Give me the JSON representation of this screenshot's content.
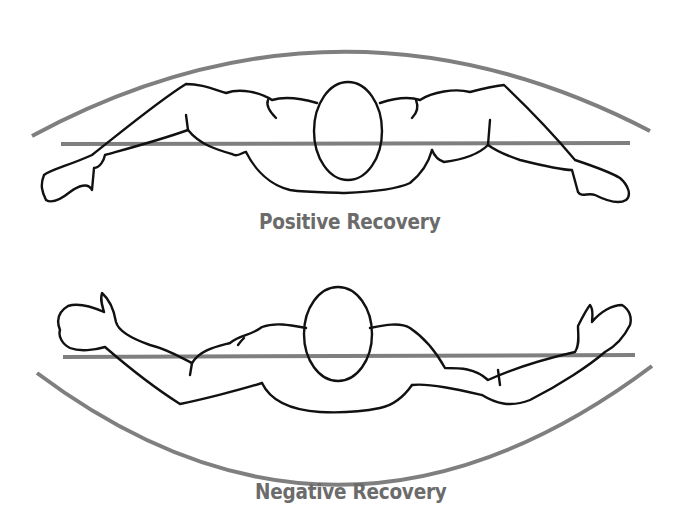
{
  "figure": {
    "panels": [
      {
        "label": "Positive Recovery",
        "arc_direction": "convex-up",
        "description": "Swimmer viewed from front, arms swept up and outward above the horizontal reference line"
      },
      {
        "label": "Negative Recovery",
        "arc_direction": "concave-up",
        "description": "Swimmer viewed from front, arms raised with hands high but elbows dropping below the horizontal reference line"
      }
    ],
    "colors": {
      "line": "#7f7f7f",
      "outline": "#111111",
      "label": "#6b6b6b",
      "background": "#ffffff"
    }
  }
}
